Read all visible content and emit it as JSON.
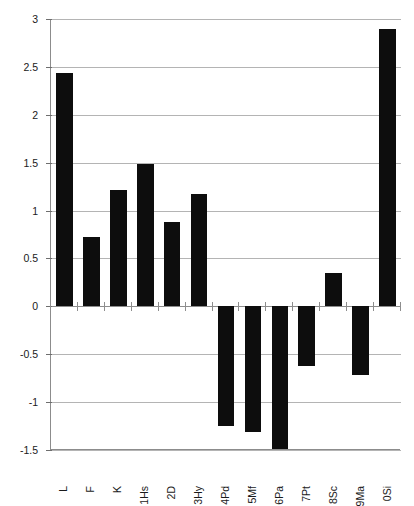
{
  "chart_data": {
    "type": "bar",
    "title": "",
    "subtitle": "",
    "xlabel": "",
    "ylabel": "",
    "categories": [
      "L",
      "F",
      "K",
      "1Hs",
      "2D",
      "3Hy",
      "4Pd",
      "5Mf",
      "6Pa",
      "7Pt",
      "8Sc",
      "9Ma",
      "0Si"
    ],
    "values": [
      2.44,
      0.72,
      1.21,
      1.49,
      0.88,
      1.17,
      -1.25,
      -1.31,
      -1.49,
      -0.62,
      0.35,
      -0.72,
      2.9
    ],
    "series": [
      {
        "name": "",
        "values": [
          2.44,
          0.72,
          1.21,
          1.49,
          0.88,
          1.17,
          -1.25,
          -1.31,
          -1.49,
          -0.62,
          0.35,
          -0.72,
          2.9
        ]
      }
    ],
    "ylim": [
      -1.5,
      3
    ],
    "yticks": [
      3,
      2.5,
      2,
      1.5,
      1,
      0.5,
      0,
      -0.5,
      -1,
      -1.5
    ],
    "ytick_labels": [
      "3",
      "2.5",
      "2",
      "1.5",
      "1",
      "0.5",
      "0",
      "-0.5",
      "-1",
      "-1.5"
    ],
    "grid": true,
    "legend": false,
    "legend_position": "none",
    "bar_color": "#0d0d0d",
    "gridline_color": "#b4b4b4",
    "axis_color": "#8c8c8c",
    "xlabel_rotation": 90
  },
  "axes": {
    "y": {
      "labels": [
        "3",
        "2.5",
        "2",
        "1.5",
        "1",
        "0.5",
        "0",
        "-0.5",
        "-1",
        "-1.5"
      ]
    },
    "x": {
      "labels": [
        "L",
        "F",
        "K",
        "1Hs",
        "2D",
        "3Hy",
        "4Pd",
        "5Mf",
        "6Pa",
        "7Pt",
        "8Sc",
        "9Ma",
        "0Si"
      ]
    }
  }
}
